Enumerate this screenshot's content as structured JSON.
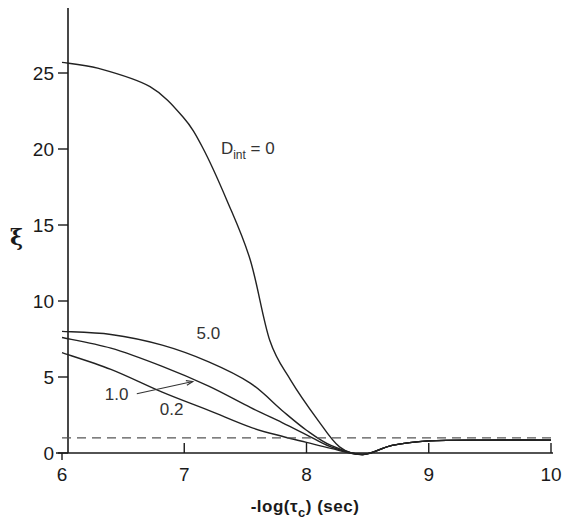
{
  "chart_data": {
    "type": "line",
    "title": "",
    "xlabel": "-log(τc) (sec)",
    "ylabel": "ξ",
    "xlim": [
      6,
      10
    ],
    "ylim": [
      0,
      28
    ],
    "xticks": [
      6,
      7,
      8,
      9,
      10
    ],
    "xtick_labels": [
      "6",
      "7",
      "8",
      "9",
      "10"
    ],
    "yticks": [
      0,
      5,
      10,
      15,
      20,
      25
    ],
    "ytick_labels": [
      "0",
      "5",
      "10",
      "15",
      "20",
      "25"
    ],
    "grid": false,
    "legend": "inline annotations",
    "series": [
      {
        "name": "D_int = 0",
        "label_main": "D",
        "label_sub": "int",
        "label_rest": " = 0",
        "x": [
          6.0,
          6.3,
          6.72,
          6.99,
          7.15,
          7.35,
          7.54,
          7.7,
          7.87,
          8.09,
          8.27,
          8.46,
          8.7,
          9.0,
          9.5,
          10.0
        ],
        "y": [
          25.7,
          25.3,
          24.1,
          22.1,
          20.1,
          16.6,
          12.7,
          7.4,
          4.8,
          2.2,
          0.4,
          -0.1,
          0.5,
          0.8,
          0.85,
          0.85
        ]
      },
      {
        "name": "D_int = 5.0",
        "label": "5.0",
        "x": [
          6.0,
          6.4,
          6.82,
          7.2,
          7.54,
          7.8,
          8.0,
          8.2,
          8.46,
          8.7,
          9.0,
          9.5,
          10.0
        ],
        "y": [
          8.0,
          7.8,
          7.1,
          6.0,
          4.6,
          2.8,
          1.5,
          0.5,
          -0.1,
          0.5,
          0.8,
          0.85,
          0.85
        ]
      },
      {
        "name": "D_int = 1.0",
        "label": "1.0",
        "x": [
          6.0,
          6.4,
          6.82,
          7.2,
          7.54,
          7.8,
          8.0,
          8.2,
          8.46,
          8.7,
          9.0,
          9.5,
          10.0
        ],
        "y": [
          7.6,
          6.9,
          5.7,
          4.4,
          3.0,
          2.0,
          1.2,
          0.4,
          -0.1,
          0.5,
          0.8,
          0.85,
          0.85
        ]
      },
      {
        "name": "D_int = 0.2",
        "label": "0.2",
        "x": [
          6.0,
          6.4,
          6.82,
          7.2,
          7.54,
          7.8,
          8.0,
          8.2,
          8.46,
          8.7,
          9.0,
          9.5,
          10.0
        ],
        "y": [
          6.6,
          5.5,
          4.0,
          2.8,
          1.7,
          1.1,
          0.7,
          0.3,
          -0.1,
          0.5,
          0.8,
          0.85,
          0.85
        ]
      },
      {
        "name": "reference (dashed)",
        "style": "dashed",
        "x": [
          6.0,
          10.0
        ],
        "y": [
          1.0,
          1.0
        ]
      }
    ],
    "annotations": [
      {
        "text": "D_int = 0",
        "x": 7.3,
        "y": 19.7
      },
      {
        "text": "5.0",
        "x": 7.1,
        "y": 7.5
      },
      {
        "text": "1.0",
        "x": 6.35,
        "y": 3.5,
        "arrow_to": [
          7.07,
          4.7
        ]
      },
      {
        "text": "0.2",
        "x": 6.8,
        "y": 2.5
      }
    ]
  },
  "layout": {
    "x_px": [
      62,
      551
    ],
    "y_px_zero": 453,
    "y_px_per_unit": 15.2,
    "line_color": "#222222",
    "dash_color": "#555555"
  }
}
